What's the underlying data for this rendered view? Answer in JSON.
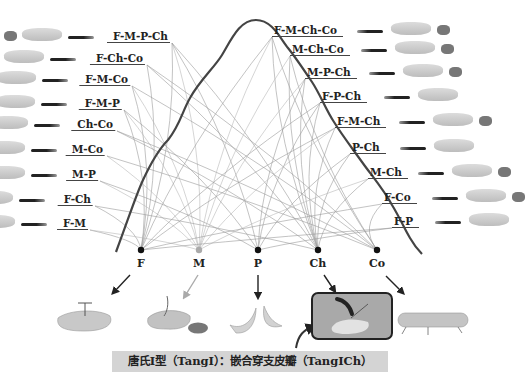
{
  "diagram": {
    "nodes": [
      {
        "id": "F",
        "label": "F",
        "color": "#111111"
      },
      {
        "id": "M",
        "label": "M",
        "color": "#aaaaaa"
      },
      {
        "id": "P",
        "label": "P",
        "color": "#111111"
      },
      {
        "id": "Ch",
        "label": "Ch",
        "color": "#111111"
      },
      {
        "id": "Co",
        "label": "Co",
        "color": "#111111"
      }
    ],
    "left_combinations": [
      "F-M-P-Ch",
      "F-Ch-Co",
      "F-M-Co",
      "F-M-P",
      "Ch-Co",
      "M-Co",
      "M-P",
      "F-Ch",
      "F-M"
    ],
    "right_combinations": [
      "F-M-Ch-Co",
      "M-Ch-Co",
      "M-P-Ch",
      "F-P-Ch",
      "F-M-Ch",
      "P-Ch",
      "M-Ch",
      "F-Co",
      "F-P"
    ],
    "caption": "唐氏Ⅰ型（TangⅠ）：嵌合穿支皮瓣（TangⅠCh）",
    "highlighted_component": "Ch",
    "colors": {
      "curve": "#444444",
      "edge": "#9a9a9a",
      "caption_bg": "#d4d4d4",
      "tissue": "#c9c9c9",
      "muscle_patch": "#777777"
    }
  }
}
